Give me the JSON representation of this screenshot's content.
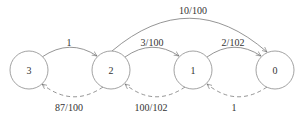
{
  "diagram": {
    "type": "state-transition-graph",
    "nodes": [
      {
        "id": "3",
        "label": "3",
        "cx": 29,
        "cy": 70
      },
      {
        "id": "2",
        "label": "2",
        "cx": 111,
        "cy": 70
      },
      {
        "id": "1",
        "label": "1",
        "cx": 193,
        "cy": 70
      },
      {
        "id": "0",
        "label": "0",
        "cx": 275,
        "cy": 70
      }
    ],
    "edges": [
      {
        "from": "3",
        "to": "2",
        "label": "1",
        "style": "solid"
      },
      {
        "from": "2",
        "to": "1",
        "label": "3/100",
        "style": "solid"
      },
      {
        "from": "1",
        "to": "0",
        "label": "2/102",
        "style": "solid"
      },
      {
        "from": "2",
        "to": "0",
        "label": "10/100",
        "style": "solid"
      },
      {
        "from": "2",
        "to": "3",
        "label": "87/100",
        "style": "dashed"
      },
      {
        "from": "1",
        "to": "2",
        "label": "100/102",
        "style": "dashed"
      },
      {
        "from": "0",
        "to": "1",
        "label": "1",
        "style": "dashed"
      }
    ]
  }
}
